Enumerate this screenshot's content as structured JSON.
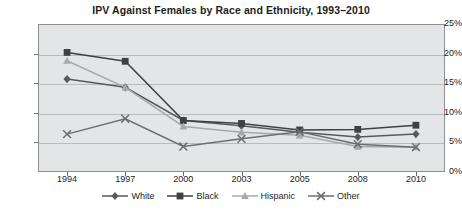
{
  "chart_data": {
    "type": "line",
    "title": "IPV Against Females by Race and Ethnicity, 1993–2010",
    "xlabel": "",
    "ylabel": "",
    "categories": [
      "1994",
      "1997",
      "2000",
      "2003",
      "2005",
      "2008",
      "2010"
    ],
    "ylim": [
      0,
      25
    ],
    "ytick_labels": [
      "0%",
      "5%",
      "10%",
      "15%",
      "20%",
      "25%"
    ],
    "ytick_values": [
      0,
      5,
      10,
      15,
      20,
      25
    ],
    "grid": true,
    "legend_position": "bottom",
    "series": [
      {
        "name": "White",
        "marker": "diamond",
        "color": "#58595b",
        "values": [
          15.7,
          14.3,
          8.7,
          7.8,
          6.7,
          5.9,
          6.4
        ]
      },
      {
        "name": "Black",
        "marker": "square",
        "color": "#404042",
        "values": [
          20.2,
          18.7,
          8.7,
          8.2,
          7.1,
          7.2,
          7.9
        ]
      },
      {
        "name": "Hispanic",
        "marker": "triangle",
        "color": "#a6a8ab",
        "values": [
          18.8,
          14.3,
          7.7,
          6.7,
          6.2,
          4.3,
          4.2
        ]
      },
      {
        "name": "Other",
        "marker": "cross",
        "color": "#6d6e71",
        "values": [
          6.4,
          9.0,
          4.3,
          5.6,
          6.8,
          4.7,
          4.2
        ]
      }
    ]
  },
  "colors": {
    "plot_background": "#e4e5e7",
    "plot_border": "#8d8f92",
    "gridline": "#b9bbbe",
    "text": "#1d1d1d"
  }
}
